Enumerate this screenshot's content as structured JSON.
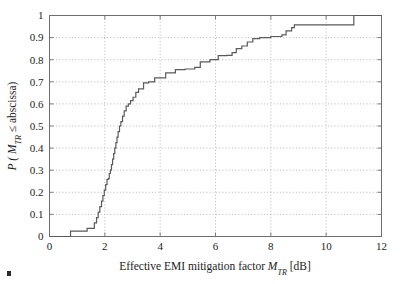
{
  "figure": {
    "background_color": "#ffffff",
    "corner_mark_color": "#2b2b2b"
  },
  "chart_data": {
    "type": "line",
    "subtype": "empirical-cdf-step",
    "title": "",
    "xlabel_parts": {
      "prefix": "Effective EMI mitigation factor ",
      "symbol": "M",
      "subscript": "TR",
      "suffix": " [dB]"
    },
    "xlabel": "Effective EMI mitigation factor M_TR [dB]",
    "ylabel_parts": {
      "prefix": "P ( ",
      "symbol": "M",
      "subscript": "TR",
      "middle": " ≤ abscissa)"
    },
    "ylabel": "P ( M_TR ≤ abscissa)",
    "xlim": [
      0,
      12
    ],
    "ylim": [
      0,
      1
    ],
    "xticks": [
      0,
      2,
      4,
      6,
      8,
      10,
      12
    ],
    "xtick_labels": [
      "0",
      "2",
      "4",
      "6",
      "8",
      "10",
      "12"
    ],
    "yticks": [
      0,
      0.1,
      0.2,
      0.3,
      0.4,
      0.5,
      0.6,
      0.7,
      0.8,
      0.9,
      1
    ],
    "ytick_labels": [
      "0",
      "0.1",
      "0.2",
      "0.3",
      "0.4",
      "0.5",
      "0.6",
      "0.7",
      "0.8",
      "0.9",
      "1"
    ],
    "grid": true,
    "grid_style": "dotted",
    "grid_color": "#9b9b9b",
    "axis_color": "#6e6e6e",
    "legend": null,
    "series": [
      {
        "name": "Effective EMI mitigation factor ECDF",
        "color": "#5a5a5a",
        "line_width": 1.2,
        "step": "post",
        "x": [
          0.0,
          0.72,
          0.76,
          1.3,
          1.36,
          1.55,
          1.62,
          1.7,
          1.76,
          1.82,
          1.88,
          1.93,
          1.98,
          2.03,
          2.08,
          2.12,
          2.16,
          2.2,
          2.24,
          2.28,
          2.32,
          2.36,
          2.4,
          2.44,
          2.48,
          2.53,
          2.58,
          2.64,
          2.7,
          2.77,
          2.85,
          2.93,
          3.02,
          3.12,
          3.22,
          3.4,
          3.58,
          3.8,
          4.2,
          4.55,
          4.9,
          5.25,
          5.45,
          5.8,
          6.1,
          6.4,
          6.6,
          6.75,
          6.95,
          7.15,
          7.35,
          7.6,
          8.0,
          8.4,
          8.55,
          8.75,
          8.85,
          10.95,
          11.0,
          12.0
        ],
        "y": [
          0.0,
          0.0,
          0.024,
          0.024,
          0.037,
          0.037,
          0.062,
          0.085,
          0.11,
          0.135,
          0.16,
          0.185,
          0.21,
          0.235,
          0.258,
          0.262,
          0.285,
          0.3,
          0.325,
          0.35,
          0.375,
          0.4,
          0.425,
          0.45,
          0.475,
          0.5,
          0.52,
          0.545,
          0.568,
          0.59,
          0.6,
          0.615,
          0.63,
          0.652,
          0.668,
          0.695,
          0.7,
          0.718,
          0.74,
          0.755,
          0.758,
          0.765,
          0.79,
          0.8,
          0.818,
          0.82,
          0.832,
          0.85,
          0.862,
          0.88,
          0.895,
          0.9,
          0.905,
          0.912,
          0.93,
          0.945,
          0.958,
          0.958,
          1.0,
          1.0
        ],
        "annotations": [
          {
            "x": 0.75,
            "y": 0.02,
            "note": "first observation, CDF rises off zero"
          },
          {
            "x": 2.3,
            "y": 0.37,
            "note": "steepest ascent region"
          },
          {
            "x": 3.2,
            "y": 0.7,
            "note": "knee of the curve near 0.70"
          },
          {
            "x": 7.4,
            "y": 0.9,
            "note": "reaches 0.90 around 7.4 dB"
          },
          {
            "x": 8.85,
            "y": 0.958,
            "note": "plateau at ~0.96"
          },
          {
            "x": 11.0,
            "y": 1.0,
            "note": "final step to 1 at ~11 dB"
          }
        ]
      }
    ]
  }
}
